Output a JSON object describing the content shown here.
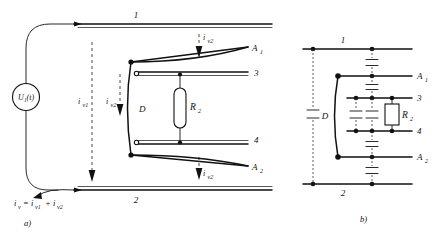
{
  "figure": {
    "background_color": "#ffffff",
    "ink_color": "#111111",
    "dash_color": "#333333"
  },
  "panel_a": {
    "caption": "a)",
    "source": {
      "label": "U",
      "subscript": "1",
      "argument": "(t)",
      "full": "U₁(t)"
    },
    "conductor_labels": {
      "top": "1",
      "bottom": "2"
    },
    "inner_labels": {
      "upper": "3",
      "lower": "4"
    },
    "plate_labels": {
      "upper": "A",
      "upper_sub": "1",
      "lower": "A",
      "lower_sub": "2"
    },
    "gap_label": "D",
    "resistor": {
      "label": "R",
      "subscript": "2",
      "full": "R₂"
    },
    "currents": [
      {
        "name": "i",
        "sub": "v1",
        "position": "left-vertical"
      },
      {
        "name": "i",
        "sub": "v2",
        "position": "mid-vertical"
      },
      {
        "name": "i",
        "sub": "v2",
        "position": "top-arrow"
      },
      {
        "name": "i",
        "sub": "v2",
        "position": "bottom-arrow"
      }
    ],
    "equation": {
      "lhs": "i",
      "lhs_sub": "v",
      "rhs_1": "i",
      "rhs_1_sub": "v1",
      "rhs_2": "i",
      "rhs_2_sub": "v2",
      "full": "iᵥ = iᵥ₁ + iᵥ₂"
    }
  },
  "panel_b": {
    "caption": "b)",
    "conductor_labels": {
      "top": "1",
      "bottom": "2"
    },
    "inner_labels": {
      "upper": "3",
      "lower": "4"
    },
    "plate_labels": {
      "upper": "A",
      "upper_sub": "1",
      "lower": "A",
      "lower_sub": "2"
    },
    "gap_label": "D",
    "resistor": {
      "label": "R",
      "subscript": "2",
      "full": "R₂"
    },
    "capacitor_count": 6,
    "capacitor_symbol": "parallel-plate"
  }
}
